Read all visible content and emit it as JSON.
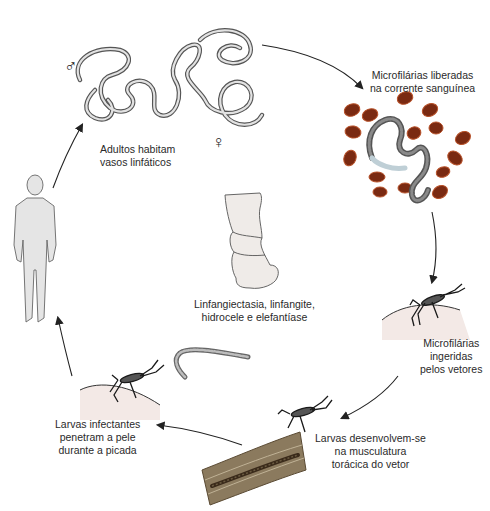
{
  "diagram": {
    "type": "life-cycle",
    "stages": [
      {
        "id": "adults",
        "lines": [
          "Adultos habitam",
          "vasos linfáticos"
        ]
      },
      {
        "id": "microfilariae-blood",
        "lines": [
          "Microfilárias liberadas",
          "na corrente sanguínea"
        ]
      },
      {
        "id": "ingested",
        "lines": [
          "Microfilárias",
          "ingeridas",
          "pelos vetores"
        ]
      },
      {
        "id": "larvae-develop",
        "lines": [
          "Larvas desenvolvem-se",
          "na musculatura",
          "torácica do vetor"
        ]
      },
      {
        "id": "larvae-penetrate",
        "lines": [
          "Larvas infectantes",
          "penetram a pele",
          "durante a picada"
        ]
      }
    ],
    "center": {
      "lines": [
        "Linfangiectasia, linfangite,",
        "hidrocele e elefantíase"
      ]
    },
    "symbols": {
      "male": "♂",
      "female": "♀"
    },
    "colors": {
      "blood_cell": "#7a2a12",
      "blood_cell_rim": "#b8522a",
      "worm_fill": "#d9d9d9",
      "worm_outline": "#555555",
      "microfilaria": "#6a6a6a",
      "skin": "#f3e9e6",
      "muscle": "#8b7a5e",
      "arrow": "#222222"
    }
  }
}
